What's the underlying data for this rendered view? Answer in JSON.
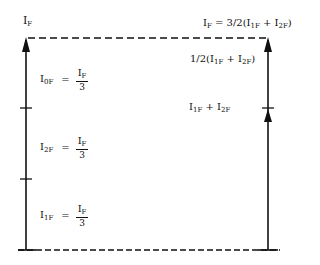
{
  "diagram": {
    "top_left_label": {
      "main": "I",
      "sub": "F"
    },
    "top_right_label": {
      "prefix": "I",
      "prefix_sub": "F",
      "rest": " = 3/2(I",
      "sub1": "1F",
      "mid": " + I",
      "sub2": "2F",
      "end": ")"
    },
    "right_mid_label": {
      "prefix": "1/2(I",
      "sub1": "1F",
      "mid": " + I",
      "sub2": "2F",
      "end": ")"
    },
    "right_lower_label": {
      "prefix": "I",
      "sub1": "1F",
      "mid": " + I",
      "sub2": "2F"
    },
    "segments": [
      {
        "lhs": "I",
        "lhs_sub": "0F",
        "equals": "=",
        "num": "I",
        "num_sub": "F",
        "den": "3"
      },
      {
        "lhs": "I",
        "lhs_sub": "2F",
        "equals": "=",
        "num": "I",
        "num_sub": "F",
        "den": "3"
      },
      {
        "lhs": "I",
        "lhs_sub": "1F",
        "equals": "=",
        "num": "I",
        "num_sub": "F",
        "den": "3"
      }
    ],
    "colors": {
      "line": "#111111",
      "background": "#ffffff"
    }
  }
}
